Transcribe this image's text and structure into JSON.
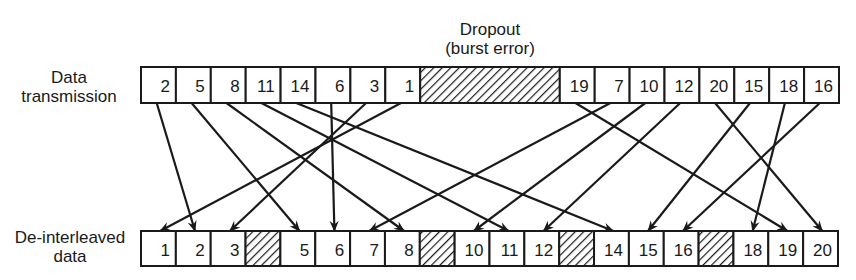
{
  "labels": {
    "top_row": [
      "Data",
      "transmission"
    ],
    "bottom_row": [
      "De-interleaved",
      "data"
    ],
    "dropout": [
      "Dropout",
      "(burst error)"
    ]
  },
  "colors": {
    "ink": "#1a1a1a",
    "background": "#ffffff"
  },
  "top_row": {
    "x_start": 141,
    "y": 67,
    "height": 36,
    "cell_width": 34.9,
    "cells": [
      {
        "value": "2"
      },
      {
        "value": "5"
      },
      {
        "value": "8"
      },
      {
        "value": "11"
      },
      {
        "value": "14"
      },
      {
        "value": "6"
      },
      {
        "value": "3"
      },
      {
        "value": "1"
      },
      {
        "value": "",
        "dropout": true,
        "span": 4
      },
      {
        "value": "19"
      },
      {
        "value": "7"
      },
      {
        "value": "10"
      },
      {
        "value": "12"
      },
      {
        "value": "20"
      },
      {
        "value": "15"
      },
      {
        "value": "18"
      },
      {
        "value": "16"
      }
    ]
  },
  "bottom_row": {
    "x_start": 141,
    "y": 231,
    "height": 35,
    "cell_width": 34.85,
    "cells": [
      {
        "value": "1"
      },
      {
        "value": "2"
      },
      {
        "value": "3"
      },
      {
        "value": "",
        "dropout": true
      },
      {
        "value": "5"
      },
      {
        "value": "6"
      },
      {
        "value": "7"
      },
      {
        "value": "8"
      },
      {
        "value": "",
        "dropout": true
      },
      {
        "value": "10"
      },
      {
        "value": "11"
      },
      {
        "value": "12"
      },
      {
        "value": "",
        "dropout": true
      },
      {
        "value": "14"
      },
      {
        "value": "15"
      },
      {
        "value": "16"
      },
      {
        "value": "",
        "dropout": true
      },
      {
        "value": "18"
      },
      {
        "value": "19"
      },
      {
        "value": "20"
      }
    ]
  },
  "mapping_note": "Each transmitted sample arrow points to its position in the de-interleaved sequence; lost samples 4, 9, 13, 17 appear as hatched cells."
}
